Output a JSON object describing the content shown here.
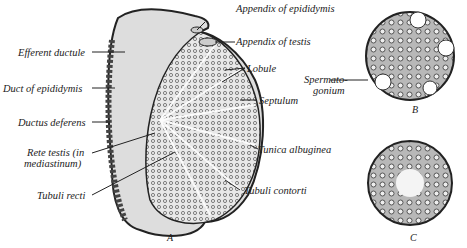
{
  "figure": {
    "panels": [
      {
        "id": "A",
        "caption": "A"
      },
      {
        "id": "B",
        "caption": "B"
      },
      {
        "id": "C",
        "caption": "C"
      }
    ],
    "labels": {
      "appendix_epididymis": "Appendix of epididymis",
      "appendix_testis": "Appendix of testis",
      "efferent_ductule": "Efferent ductule",
      "duct_epididymis": "Duct of epididymis",
      "ductus_deferens": "Ductus deferens",
      "rete_testis_1": "Rete testis (in",
      "rete_testis_2": "mediastinum)",
      "tubuli_recti": "Tubuli recti",
      "lobule": "Lobule",
      "septulum": "Septulum",
      "tunica_albuginea": "Tunica albuginea",
      "tubuli_contorti": "Tubuli contorti",
      "spermatogonium_1": "Spermato-",
      "spermatogonium_2": "gonium"
    }
  }
}
